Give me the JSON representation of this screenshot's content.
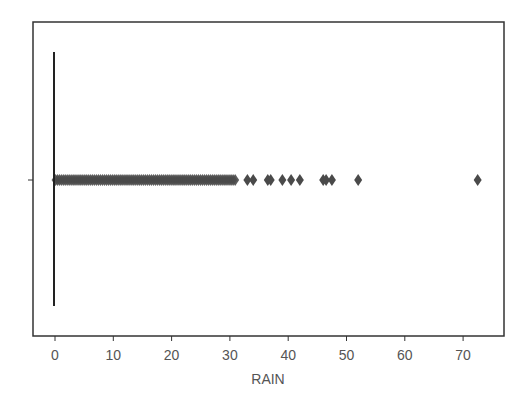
{
  "chart_data": {
    "type": "box",
    "orientation": "horizontal",
    "title": "",
    "xlabel": "RAIN",
    "ylabel": "",
    "xlim": [
      -3.8,
      76.5
    ],
    "xticks": [
      0,
      10,
      20,
      30,
      40,
      50,
      60,
      70
    ],
    "xtick_labels": [
      "0",
      "10",
      "20",
      "30",
      "40",
      "50",
      "60",
      "70"
    ],
    "yticks": [
      0
    ],
    "ytick_labels": [
      ""
    ],
    "grid": false,
    "legend": null,
    "series": [
      {
        "name": "RAIN",
        "min": 0,
        "q1": 0,
        "median": 0,
        "q3": 0,
        "max": 0,
        "outlier_band": [
          0.1,
          31
        ],
        "outliers": [
          0.2,
          1,
          2,
          3,
          4,
          5,
          6,
          7,
          8,
          9,
          10,
          11,
          12,
          13,
          14,
          15,
          16,
          17,
          18,
          19,
          20,
          21,
          22,
          23,
          24,
          25,
          26,
          27,
          28,
          29,
          30,
          31,
          33,
          34,
          36.5,
          37,
          39,
          40.5,
          42,
          46,
          46.5,
          47.5,
          52,
          72.5
        ]
      }
    ],
    "colors": {
      "box_fill": "#3a76af",
      "outlier_fill": "#4a4a4a",
      "line": "#222222",
      "frame": "#333333"
    }
  },
  "axes": {
    "x_label": "RAIN",
    "tick_labels": [
      "0",
      "10",
      "20",
      "30",
      "40",
      "50",
      "60",
      "70"
    ]
  }
}
